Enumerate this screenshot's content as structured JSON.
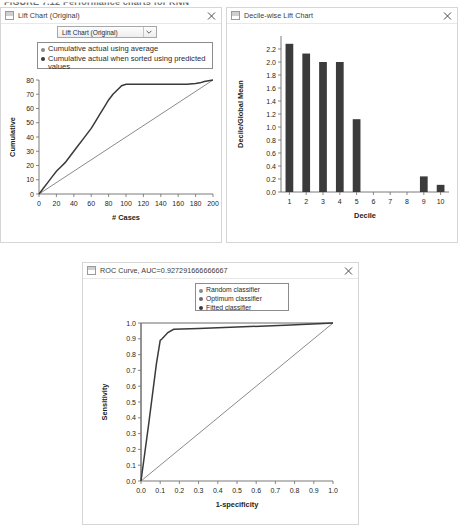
{
  "figure_caption": "FIGURE 7.12  Performance charts for KNN",
  "panels": [
    {
      "title": "Lift Chart (Original)",
      "window_icon": "window-icon",
      "close_icon": "close-icon",
      "dropdown": {
        "value": "Lift Chart (Original)",
        "arrow_icon": "chevron-down-icon"
      },
      "legend": [
        {
          "label": "Cumulative actual using average",
          "color": "#8a8a8a"
        },
        {
          "label": "Cumulative actual when sorted using predicted values",
          "color": "#3a3a3a"
        }
      ]
    },
    {
      "title": "Decile-wise Lift Chart",
      "window_icon": "window-icon",
      "close_icon": "close-icon"
    },
    {
      "title": "ROC Curve, AUC=0.927291666666667",
      "window_icon": "window-icon",
      "close_icon": "close-icon",
      "legend": [
        {
          "label": "Random classifier",
          "color": "#8a8a8a"
        },
        {
          "label": "Optimum classifier",
          "color": "#6a6a6a"
        },
        {
          "label": "Fitted classifier",
          "color": "#3a3a3a"
        }
      ]
    }
  ],
  "chart_data": [
    {
      "type": "line",
      "title": "Lift Chart (Original)",
      "xlabel": "# Cases",
      "ylabel": "Cumulative",
      "xlim": [
        0,
        200
      ],
      "ylim": [
        0,
        80
      ],
      "xticks": [
        0,
        20,
        40,
        60,
        80,
        100,
        120,
        140,
        160,
        180,
        200
      ],
      "yticks": [
        0,
        10,
        20,
        30,
        40,
        50,
        60,
        70,
        80
      ],
      "grid": false,
      "legend_position": "top",
      "series": [
        {
          "name": "Cumulative actual using average",
          "color": "#8a8a8a",
          "x": [
            0,
            200
          ],
          "y": [
            0,
            80
          ]
        },
        {
          "name": "Cumulative actual when sorted using predicted values",
          "color": "#3a3a3a",
          "x": [
            0,
            5,
            10,
            15,
            20,
            25,
            30,
            35,
            40,
            45,
            50,
            55,
            60,
            65,
            70,
            75,
            80,
            85,
            90,
            95,
            100,
            120,
            140,
            160,
            170,
            180,
            185,
            190,
            195,
            200
          ],
          "y": [
            0,
            4,
            8,
            12,
            16,
            19,
            22,
            26,
            30,
            34,
            38,
            42,
            46,
            51,
            56,
            61,
            66,
            70,
            73,
            76,
            77,
            77,
            77,
            77,
            77,
            77.5,
            78,
            79,
            79.5,
            80
          ]
        }
      ]
    },
    {
      "type": "bar",
      "title": "Decile-wise Lift Chart",
      "xlabel": "Decile",
      "ylabel": "Decile/Global Mean",
      "categories": [
        "1",
        "2",
        "3",
        "4",
        "5",
        "6",
        "7",
        "8",
        "9",
        "10"
      ],
      "values": [
        2.28,
        2.13,
        2.0,
        2.0,
        1.12,
        0.0,
        0.0,
        0.0,
        0.24,
        0.11
      ],
      "ylim": [
        0.0,
        2.4
      ],
      "yticks": [
        0.0,
        0.2,
        0.4,
        0.6,
        0.8,
        1.0,
        1.2,
        1.4,
        1.6,
        1.8,
        2.0,
        2.2
      ],
      "bar_color": "#3b3b3b",
      "grid": false
    },
    {
      "type": "line",
      "title": "ROC Curve, AUC=0.927291666666667",
      "xlabel": "1-specificity",
      "ylabel": "Sensitivity",
      "xlim": [
        0.0,
        1.0
      ],
      "ylim": [
        0.0,
        1.0
      ],
      "xticks": [
        0.0,
        0.1,
        0.2,
        0.3,
        0.4,
        0.5,
        0.6,
        0.7,
        0.8,
        0.9,
        1.0
      ],
      "yticks": [
        0.0,
        0.1,
        0.2,
        0.3,
        0.4,
        0.5,
        0.6,
        0.7,
        0.8,
        0.9,
        1.0
      ],
      "grid": false,
      "legend_position": "top",
      "series": [
        {
          "name": "Random classifier",
          "color": "#8a8a8a",
          "x": [
            0.0,
            1.0
          ],
          "y": [
            0.0,
            1.0
          ]
        },
        {
          "name": "Optimum classifier",
          "color": "#6a6a6a",
          "x": [
            0.0,
            0.0,
            1.0
          ],
          "y": [
            0.0,
            1.0,
            1.0
          ]
        },
        {
          "name": "Fitted classifier",
          "color": "#3a3a3a",
          "x": [
            0.0,
            0.04,
            0.08,
            0.1,
            0.11,
            0.14,
            0.17,
            0.3,
            0.5,
            0.75,
            0.92,
            1.0
          ],
          "y": [
            0.0,
            0.36,
            0.74,
            0.89,
            0.9,
            0.94,
            0.96,
            0.965,
            0.975,
            0.985,
            0.995,
            1.0
          ]
        }
      ]
    }
  ]
}
